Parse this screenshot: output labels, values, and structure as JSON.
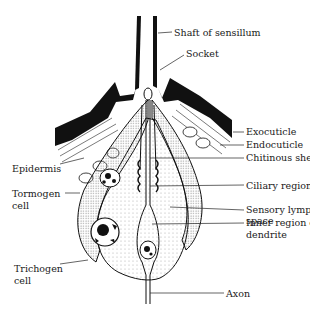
{
  "diagram": {
    "labels": {
      "shaft": "Shaft of sensillum",
      "socket": "Socket",
      "exocuticle": "Exocuticle",
      "endocuticle": "Endocuticle",
      "chitinous_sheath": "Chitinous sheath",
      "epidermis": "Epidermis",
      "ciliary_region": "Ciliary region",
      "sensory_lymph_1": "Sensory lymph",
      "sensory_lymph_2": "space",
      "tormogen_1": "Tormogen",
      "tormogen_2": "cell",
      "inner_dendrite_1": "Inner region of",
      "inner_dendrite_2": "dendrite",
      "trichogen_1": "Trichogen",
      "trichogen_2": "cell",
      "axon": "Axon"
    },
    "colors": {
      "ink": "#111111",
      "background": "#ffffff",
      "stipple": "#bdbdbd"
    }
  }
}
